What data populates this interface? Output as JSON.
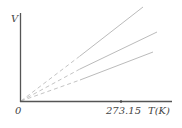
{
  "diagram": {
    "y_axis_label": "V",
    "x_axis_label": "T(K)",
    "origin_label": "0",
    "tick_label": "273.15",
    "colors": {
      "axis": "#555555",
      "line": "#bbbbbb"
    },
    "lines": [
      {
        "name": "line-1",
        "end": [
          143,
          7
        ]
      },
      {
        "name": "line-2",
        "end": [
          157,
          32
        ]
      },
      {
        "name": "line-3",
        "end": [
          153,
          52
        ]
      }
    ]
  }
}
